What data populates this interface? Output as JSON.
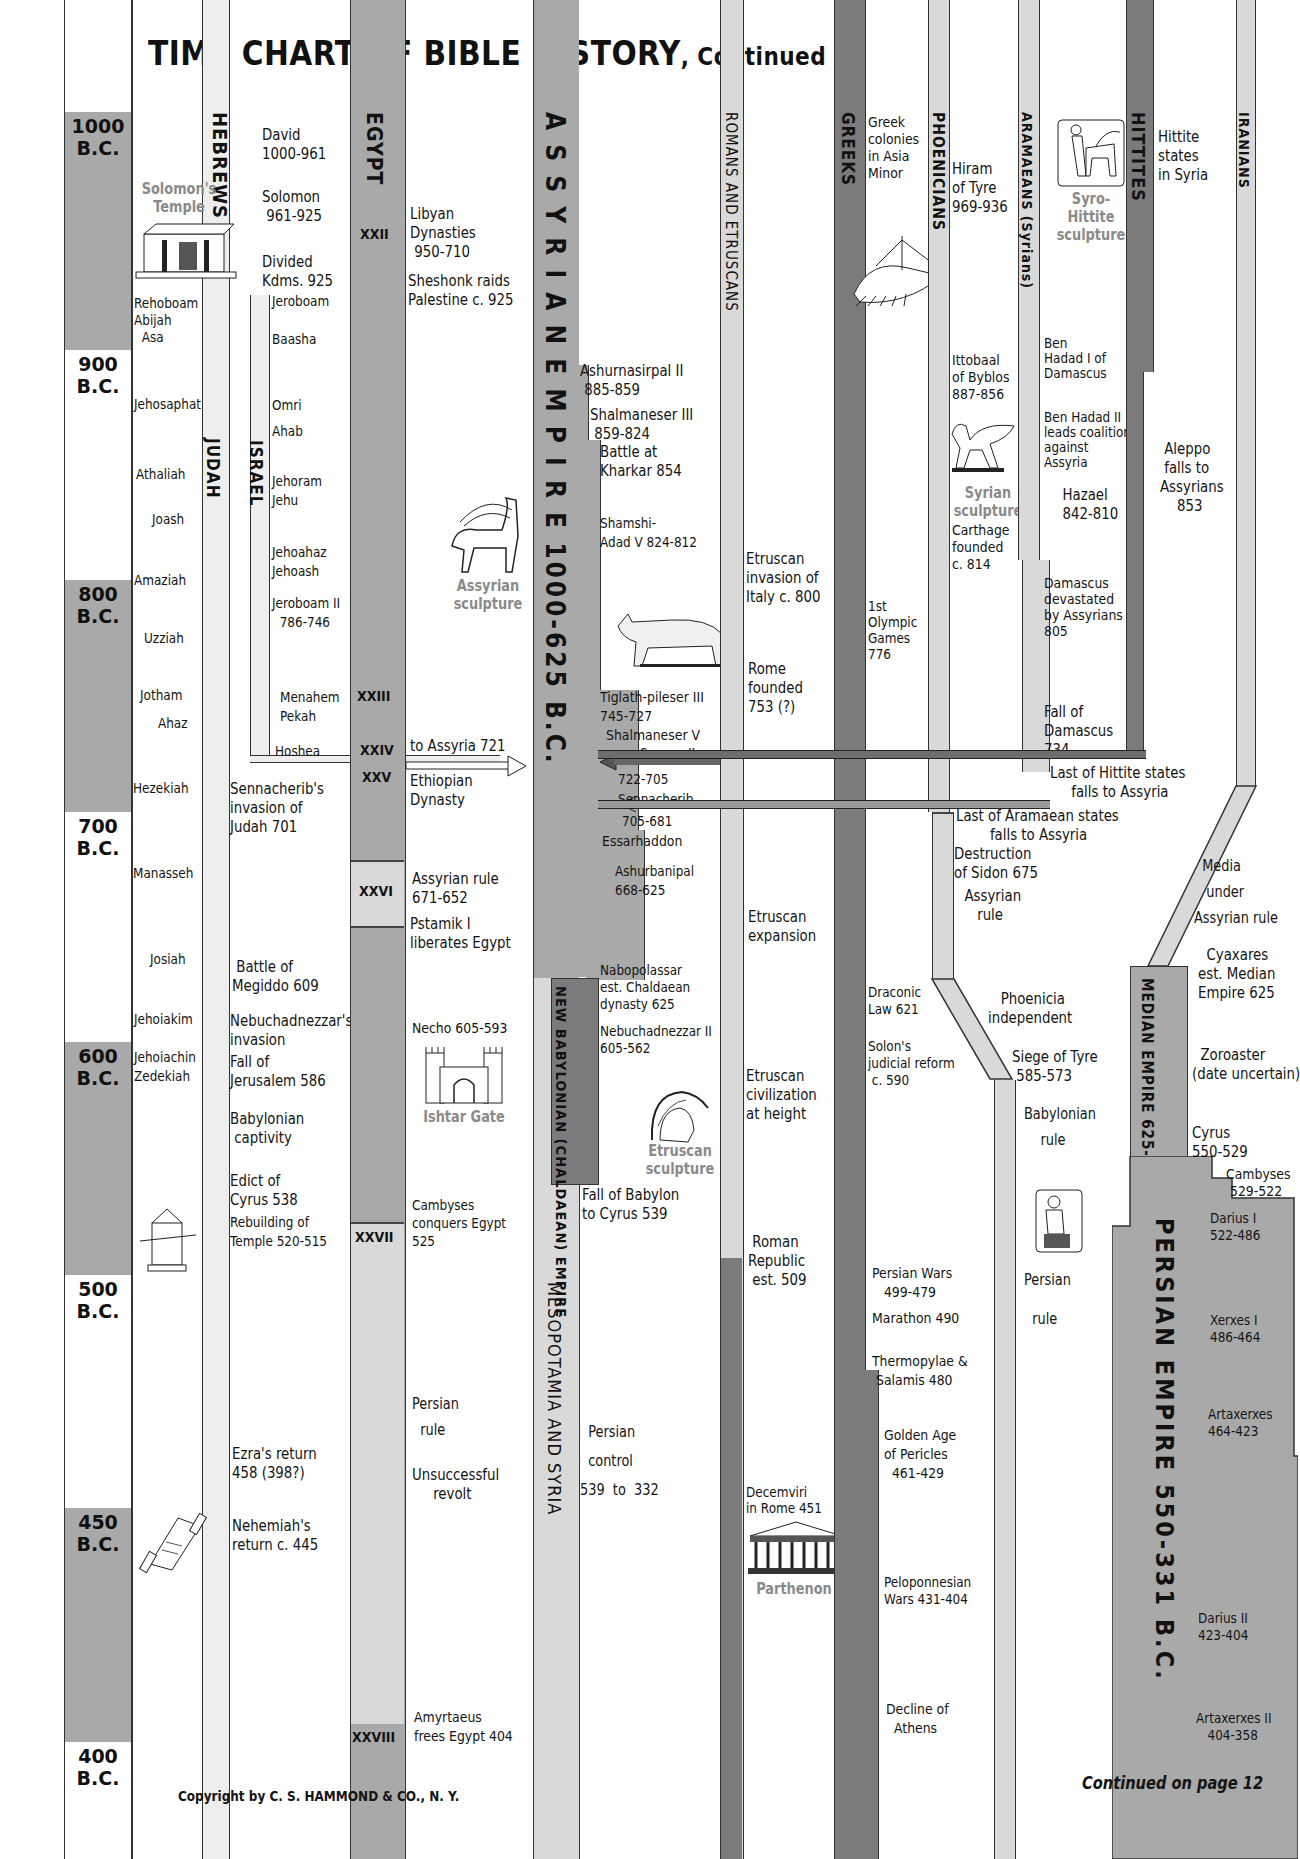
{
  "title": {
    "main": "TIME CHART OF BIBLE HISTORY",
    "suffix": ", Continued"
  },
  "footer": {
    "copyright": "Copyright by C. S. HAMMOND & CO., N. Y.",
    "continued": "Continued on page 12"
  },
  "year_axis": [
    {
      "label": "1000\nB.C.",
      "top": 112
    },
    {
      "label": "900\nB.C.",
      "top": 350
    },
    {
      "label": "800\nB.C.",
      "top": 580
    },
    {
      "label": "700\nB.C.",
      "top": 812
    },
    {
      "label": "600\nB.C.",
      "top": 1042
    },
    {
      "label": "500\nB.C.",
      "top": 1275
    },
    {
      "label": "450\nB.C.",
      "top": 1508
    },
    {
      "label": "400\nB.C.",
      "top": 1742
    }
  ],
  "columns": {
    "hebrews": "HEBREWS",
    "judah": "JUDAH",
    "israel": "ISRAEL",
    "egypt": "EGYPT",
    "assyrian_empire": "A S S Y R I A N   E M P I R E   1000-625  B.C.",
    "new_babylonian": "NEW BABYLONIAN\n(CHALDAEAN) EMPIRE",
    "mesopotamia": "MESOPOTAMIA AND SYRIA",
    "romans": "ROMANS AND ETRUSCANS",
    "greeks": "GREEKS",
    "phoenicians": "PHOENICIANS",
    "aramaeans": "ARAMAEANS (Syrians)",
    "hittites": "HITTITES",
    "iranians": "IRANIANS",
    "median_empire": "MEDIAN EMPIRE\n625-550 B.C.",
    "persian_empire": "PERSIAN EMPIRE 550-331 B.C."
  },
  "egypt_dynasties": [
    "XXII",
    "XXIII",
    "XXIV",
    "XXV",
    "XXVI",
    "XXVII",
    "XXVIII"
  ],
  "judah_kings": [
    "Rehoboam\nAbijah\n  Asa",
    "Jehosaphat",
    "Athaliah",
    "Joash",
    "Amaziah",
    "Uzziah",
    "Jotham",
    "Ahaz",
    "Hezekiah",
    "Manasseh",
    "Josiah",
    "Jehoiakim",
    "Jehoiachin\nZedekiah"
  ],
  "hebrew_events": [
    "David\n1000-961",
    "Solomon\n 961-925",
    "Divided\nKdms. 925",
    "Jeroboam",
    "Baasha",
    "Omri",
    "Ahab",
    "Jehoram\nJehu",
    "Jehoahaz\nJehoash",
    "Jeroboam II\n  786-746",
    "Menahem\nPekah",
    "Hoshea",
    "Sennacherib's\ninvasion of\nJudah 701",
    " Battle of\nMegiddo 609",
    "Nebuchadnezzar's\ninvasion",
    "Fall of\nJerusalem 586",
    "Babylonian\n captivity",
    "Edict of\nCyrus 538",
    "Rebuilding of\nTemple 520-515",
    "Ezra's return\n458 (398?)",
    "Nehemiah's\nreturn c. 445"
  ],
  "egypt_events": [
    "Libyan\nDynasties\n 950-710",
    "Sheshonk raids\nPalestine c. 925",
    "to Assyria 721",
    "Ethiopian\nDynasty",
    "Assyrian rule\n671-652",
    "Pstamik I\nliberates Egypt",
    "Necho 605-593",
    "Cambyses\nconquers Egypt\n525",
    "Persian\n\n  rule",
    "Unsuccessful\n     revolt",
    "Amyrtaeus\nfrees Egypt 404"
  ],
  "assyria_events": [
    "Ashurnasirpal II\n 885-859",
    "Shalmaneser III\n 859-824",
    "Battle at\nKharkar 854",
    "Shamshi-\nAdad V 824-812",
    "Tiglath-pileser III\n745-727",
    "Shalmaneser V",
    "Sargon II",
    "722-705",
    "Sennacherib",
    "705-681",
    "Essarhaddon",
    "Ashurbanipal\n668-625",
    "Nabopolassar\nest. Chaldaean\ndynasty 625",
    "Nebuchadnezzar II\n605-562",
    "Fall of Babylon\nto Cyrus 539",
    "  Persian\n\n  control\n\n539  to  332"
  ],
  "roman_events": [
    "Etruscan\ninvasion of\nItaly c. 800",
    "Rome\nfounded\n753 (?)",
    "Etruscan\nexpansion",
    "Etruscan\ncivilization\nat height",
    " Roman\nRepublic\n est. 509",
    "Decemviri\nin Rome 451"
  ],
  "greek_events": [
    "Greek\ncolonies\nin Asia\nMinor",
    "1st\nOlympic\nGames\n776",
    "Draconic\nLaw 621",
    "Solon's\njudicial reform\n c. 590",
    "Persian Wars\n   499-479",
    "Marathon 490",
    "Thermopylae &\n Salamis 480",
    " Golden Age\n of Pericles\n   461-429",
    "Peloponnesian\nWars 431-404",
    "Decline of\n  Athens"
  ],
  "phoenician_events": [
    "Hiram\nof Tyre\n969-936",
    "Ittobaal\nof Byblos\n887-856",
    "Carthage\nfounded\nc. 814",
    "Last of Aramaean states\n        falls to Assyria",
    "Destruction\nof Sidon 675",
    "  Assyrian\n     rule",
    "   Phoenicia\nindependent",
    "Siege of Tyre\n 585-573",
    "Babylonian\n\n    rule",
    "Persian\n\n\n  rule"
  ],
  "aramaean_events": [
    "Ben\nHadad I of\nDamascus",
    "Ben Hadad II\nleads coalition\nagainst\nAssyria",
    "  Hazael\n  842-810",
    "Damascus\ndevastated\nby Assyrians\n805",
    "Fall of\nDamascus\n734",
    "Last of Hittite states\n     falls to Assyria"
  ],
  "hittite_events": [
    "Hittite\nstates\nin Syria",
    " Aleppo\n falls to\nAssyrians\n    853"
  ],
  "iranian_events": [
    "  Media\n\n   under\n\nAssyrian rule",
    "  Cyaxares\nest. Median\nEmpire 625",
    "  Zoroaster\n(date uncertain)",
    "Cyrus\n550-529",
    "Cambyses\n 529-522",
    "Darius I\n522-486",
    "Xerxes I\n486-464",
    "Artaxerxes\n464-423",
    "Darius II\n423-404",
    "Artaxerxes II\n   404-358"
  ],
  "illustrations": {
    "solomons_temple": "Solomon's\nTemple",
    "assyrian_sculpture": "Assyrian\nsculpture",
    "syro_hittite": "Syro-\nHittite\nsculpture",
    "syrian_sculpture": "Syrian\nsculpture",
    "ishtar_gate": "Ishtar Gate",
    "etruscan_sculpture": "Etruscan\nsculpture",
    "parthenon": "Parthenon"
  },
  "colors": {
    "light": "#d9d9d9",
    "medium": "#a9a9a9",
    "dark": "#7b7b7b",
    "caption": "#8a8a8a"
  }
}
